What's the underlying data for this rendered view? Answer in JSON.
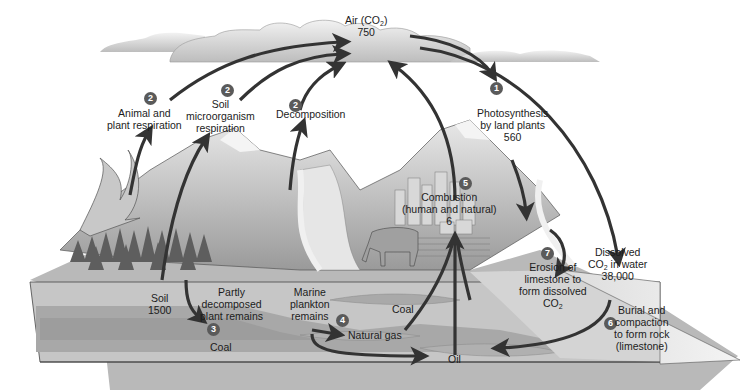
{
  "colors": {
    "arrow": "#333333",
    "badge": "#5a5a5a",
    "sky_cloud": "#cfcfcf",
    "ground_top": "#a8a8a8",
    "ground_block": "#c4c4c4",
    "fossil_layer": "#a6a6a6",
    "water": "#e0e0e0"
  },
  "reservoirs": {
    "air": {
      "line1": "Air (CO",
      "sub": "2",
      "line1_end": ")",
      "value": "750"
    },
    "soil": {
      "label": "Soil",
      "value": "1500"
    },
    "dissolved": {
      "line1": "Dissolved",
      "line2a": "CO",
      "sub": "2",
      "line2b": " in water",
      "value": "38,000"
    }
  },
  "processes": [
    {
      "badge": "1",
      "lines": [
        "Photosynthesis",
        "by land plants",
        "560"
      ]
    },
    {
      "badge": "2",
      "lines": [
        "Animal and",
        "plant respiration"
      ]
    },
    {
      "badge": "2",
      "lines": [
        "Soil",
        "microorganism",
        "respiration"
      ]
    },
    {
      "badge": "2",
      "lines": [
        "Decomposition"
      ]
    },
    {
      "badge": "3",
      "lines": [
        "Partly",
        "decomposed",
        "plant remains"
      ]
    },
    {
      "badge": "4",
      "lines": [
        "Marine",
        "plankton",
        "remains"
      ]
    },
    {
      "badge": "5",
      "lines": [
        "Combustion",
        "(human and natural)",
        "6"
      ]
    },
    {
      "badge": "6",
      "lines": [
        "Burial and",
        "compaction",
        "to form rock",
        "(limestone)"
      ]
    },
    {
      "badge": "7",
      "lines": [
        "Erosion of",
        "limestone to",
        "form dissolved"
      ],
      "last_a": "CO",
      "last_sub": "2"
    }
  ],
  "fossil_fuels": {
    "coal_left": "Coal",
    "coal_right": "Coal",
    "natural_gas": "Natural gas",
    "oil": "Oil"
  }
}
